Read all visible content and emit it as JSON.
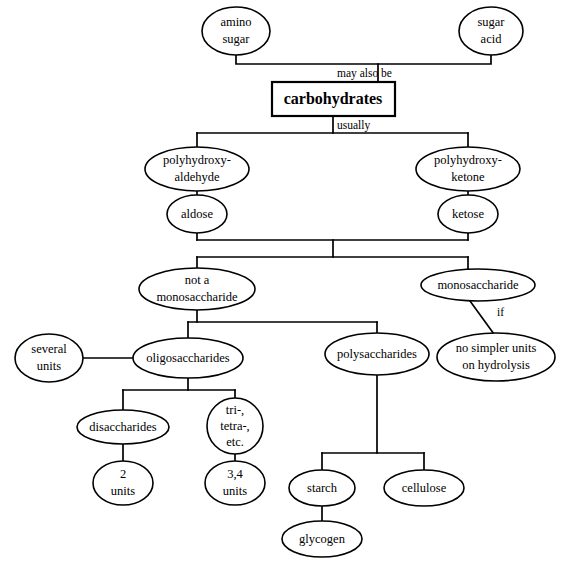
{
  "diagram": {
    "root_label": "carbohydrates",
    "colors": {
      "background": "#ffffff",
      "stroke": "#000000",
      "text": "#000000"
    },
    "nodes": {
      "amino_sugar": {
        "line1": "amino",
        "line2": "sugar"
      },
      "sugar_acid": {
        "line1": "sugar",
        "line2": "acid"
      },
      "carbohydrates": {
        "line1": "carbohydrates"
      },
      "polyhydroxy_aldehyde": {
        "line1": "polyhydroxy-",
        "line2": "aldehyde"
      },
      "polyhydroxy_ketone": {
        "line1": "polyhydroxy-",
        "line2": "ketone"
      },
      "aldose": {
        "line1": "aldose"
      },
      "ketose": {
        "line1": "ketose"
      },
      "not_a_monosaccharide": {
        "line1": "not a",
        "line2": "monosaccharide"
      },
      "monosaccharide": {
        "line1": "monosaccharide"
      },
      "no_simpler_units": {
        "line1": "no simpler units",
        "line2": "on hydrolysis"
      },
      "several_units": {
        "line1": "several",
        "line2": "units"
      },
      "oligosaccharides": {
        "line1": "oligosaccharides"
      },
      "polysaccharides": {
        "line1": "polysaccharides"
      },
      "disaccharides": {
        "line1": "disaccharides"
      },
      "tri_tetra_etc": {
        "line1": "tri-,",
        "line2": "tetra-,",
        "line3": "etc."
      },
      "two_units": {
        "line1": "2",
        "line2": "units"
      },
      "three_four_units": {
        "line1": "3,4",
        "line2": "units"
      },
      "starch": {
        "line1": "starch"
      },
      "cellulose": {
        "line1": "cellulose"
      },
      "glycogen": {
        "line1": "glycogen"
      }
    },
    "edge_labels": {
      "may_also_be": "may also be",
      "usually": "usually",
      "if": "if"
    }
  }
}
